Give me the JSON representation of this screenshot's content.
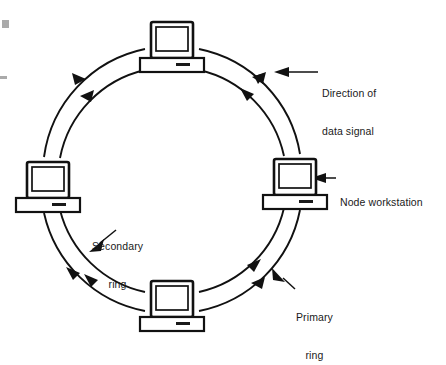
{
  "figure": {
    "kind": "network-topology-diagram",
    "topology": "FDDI dual counter-rotating ring",
    "background_color": "#ffffff",
    "line_color": "#111111"
  },
  "callouts": {
    "direction": {
      "line1": "Direction of",
      "line2": "data signal",
      "arrow": "left-pointing-arrow"
    },
    "node": {
      "line1": "Node workstation",
      "arrow": "left-pointing-arrow"
    },
    "secondary": {
      "line1": "Secondary",
      "line2": "ring",
      "arrow": "down-left-pointing-arrow"
    },
    "primary": {
      "line1": "Primary",
      "line2": "ring",
      "arrow": "up-left-pointing-arrow"
    }
  },
  "rings": [
    {
      "name": "secondary-ring",
      "role": "outer",
      "radius": 128,
      "direction": "counterclockwise"
    },
    {
      "name": "primary-ring",
      "role": "inner",
      "radius": 112,
      "direction": "clockwise"
    }
  ],
  "nodes": [
    {
      "id": "node-top",
      "position": "top",
      "cx": 172,
      "cy": 45,
      "icon": "desktop-computer-icon"
    },
    {
      "id": "node-right",
      "position": "right",
      "cx": 295,
      "cy": 182,
      "icon": "desktop-computer-icon"
    },
    {
      "id": "node-bottom",
      "position": "bottom",
      "cx": 172,
      "cy": 305,
      "icon": "desktop-computer-icon"
    },
    {
      "id": "node-left",
      "position": "left",
      "cx": 48,
      "cy": 185,
      "icon": "desktop-computer-icon"
    }
  ],
  "artifacts": [
    {
      "id": "scan-mark-square",
      "shape": "square",
      "color": "#aaaaaa"
    },
    {
      "id": "scan-mark-dash",
      "shape": "dash",
      "color": "#aaaaaa"
    }
  ]
}
